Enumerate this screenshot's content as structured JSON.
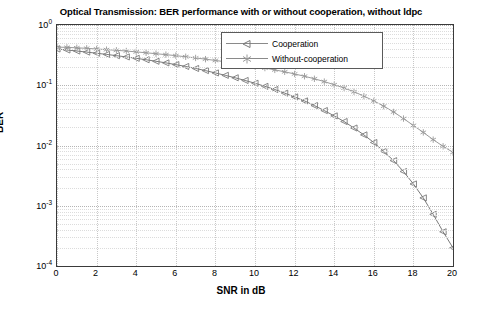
{
  "chart_data": {
    "type": "line",
    "title": "Optical Transmission: BER performance with or without cooperation, without ldpc",
    "xlabel": "SNR in dB",
    "ylabel": "BER",
    "xlim": [
      0,
      20
    ],
    "ylim": [
      0.0001,
      1
    ],
    "yscale": "log",
    "grid": true,
    "legend_position": "top-right-inside",
    "xticks": [
      "0",
      "2",
      "4",
      "6",
      "8",
      "10",
      "12",
      "14",
      "16",
      "18",
      "20"
    ],
    "yticks": [
      "10-4",
      "10-3",
      "10-2",
      "10-1",
      "100"
    ],
    "ytick_labels": [
      {
        "mantissa": "10",
        "exponent": "-4"
      },
      {
        "mantissa": "10",
        "exponent": "-3"
      },
      {
        "mantissa": "10",
        "exponent": "-2"
      },
      {
        "mantissa": "10",
        "exponent": "-1"
      },
      {
        "mantissa": "10",
        "exponent": "0"
      }
    ],
    "x": [
      0,
      0.5,
      1,
      1.5,
      2,
      2.5,
      3,
      3.5,
      4,
      4.5,
      5,
      5.5,
      6,
      6.5,
      7,
      7.5,
      8,
      8.5,
      9,
      9.5,
      10,
      10.5,
      11,
      11.5,
      12,
      12.5,
      13,
      13.5,
      14,
      14.5,
      15,
      15.5,
      16,
      16.5,
      17,
      17.5,
      18,
      18.5,
      19,
      19.5,
      20
    ],
    "series": [
      {
        "name": "Cooperation",
        "marker": "triangle-left",
        "color": "#7a7a7a",
        "values": [
          0.4,
          0.385,
          0.37,
          0.355,
          0.34,
          0.325,
          0.31,
          0.295,
          0.28,
          0.265,
          0.25,
          0.235,
          0.22,
          0.205,
          0.19,
          0.175,
          0.16,
          0.146,
          0.133,
          0.12,
          0.108,
          0.096,
          0.085,
          0.074,
          0.064,
          0.055,
          0.046,
          0.038,
          0.031,
          0.025,
          0.0195,
          0.015,
          0.0112,
          0.008,
          0.0056,
          0.0037,
          0.0023,
          0.00135,
          0.00072,
          0.00037,
          0.0002
        ]
      },
      {
        "name": "Without-cooperation",
        "marker": "asterisk",
        "color": "#9a9a9a",
        "values": [
          0.43,
          0.425,
          0.418,
          0.41,
          0.4,
          0.39,
          0.38,
          0.37,
          0.358,
          0.346,
          0.334,
          0.322,
          0.31,
          0.297,
          0.284,
          0.271,
          0.258,
          0.245,
          0.232,
          0.219,
          0.206,
          0.193,
          0.18,
          0.167,
          0.154,
          0.141,
          0.128,
          0.115,
          0.102,
          0.09,
          0.078,
          0.066,
          0.055,
          0.045,
          0.036,
          0.028,
          0.0215,
          0.0165,
          0.0125,
          0.0097,
          0.0077
        ]
      }
    ]
  },
  "legend": {
    "items": [
      {
        "label": "Cooperation"
      },
      {
        "label": "Without-cooperation"
      }
    ]
  }
}
